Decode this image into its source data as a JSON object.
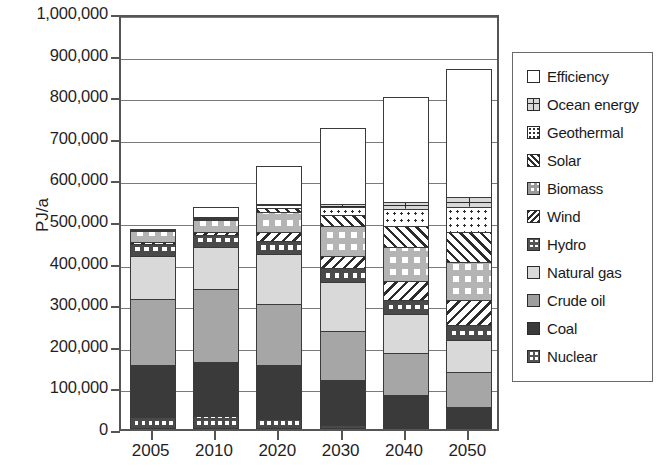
{
  "chart_data": {
    "type": "bar",
    "subtype": "stacked-column",
    "title": "",
    "xlabel": "",
    "ylabel": "PJ/a",
    "ylim": [
      0,
      1000000
    ],
    "ytick_step": 100000,
    "grid": true,
    "legend_position": "right",
    "categories": [
      "2005",
      "2010",
      "2020",
      "2030",
      "2040",
      "2050"
    ],
    "ytick_labels": [
      "0",
      "100,000",
      "200,000",
      "300,000",
      "400,000",
      "500,000",
      "600,000",
      "700,000",
      "800,000",
      "900,000",
      "1,000,000"
    ],
    "series": [
      {
        "name": "Nuclear",
        "pattern": "checker-fine",
        "values": [
          30000,
          32000,
          25000,
          10000,
          3000,
          0
        ]
      },
      {
        "name": "Coal",
        "pattern": "solid-dark",
        "values": [
          125000,
          130000,
          128000,
          108000,
          78000,
          52000
        ]
      },
      {
        "name": "Crude oil",
        "pattern": "solid-mid",
        "values": [
          158000,
          175000,
          148000,
          118000,
          100000,
          85000
        ]
      },
      {
        "name": "Natural gas",
        "pattern": "solid-light",
        "values": [
          103000,
          100000,
          120000,
          118000,
          93000,
          78000
        ]
      },
      {
        "name": "Hydro",
        "pattern": "checker-mid",
        "values": [
          30000,
          30000,
          32000,
          33000,
          35000,
          36000
        ]
      },
      {
        "name": "Wind",
        "pattern": "diag-back",
        "values": [
          3000,
          6000,
          20000,
          30000,
          45000,
          58000
        ]
      },
      {
        "name": "Biomass",
        "pattern": "checker-big",
        "values": [
          26000,
          30000,
          48000,
          70000,
          82000,
          92000
        ]
      },
      {
        "name": "Solar",
        "pattern": "diag-fwd",
        "values": [
          1000,
          3000,
          10000,
          28000,
          50000,
          72000
        ]
      },
      {
        "name": "Geothermal",
        "pattern": "dotted",
        "values": [
          1000,
          2000,
          8000,
          18000,
          42000,
          62000
        ]
      },
      {
        "name": "Ocean energy",
        "pattern": "grid-plus",
        "values": [
          0,
          1000,
          3000,
          8000,
          15000,
          22000
        ]
      },
      {
        "name": "Efficiency",
        "pattern": "white",
        "values": [
          0,
          23000,
          91000,
          184000,
          253000,
          309000
        ]
      }
    ],
    "totals": [
      477000,
      532000,
      633000,
      725000,
      796000,
      866000
    ]
  },
  "axis": {
    "y_title": "PJ/a"
  },
  "legend": {
    "items": [
      {
        "label": "Efficiency",
        "key": "efficiency"
      },
      {
        "label": "Ocean energy",
        "key": "ocean"
      },
      {
        "label": "Geothermal",
        "key": "geothermal"
      },
      {
        "label": "Solar",
        "key": "solar"
      },
      {
        "label": "Biomass",
        "key": "biomass"
      },
      {
        "label": "Wind",
        "key": "wind"
      },
      {
        "label": "Hydro",
        "key": "hydro"
      },
      {
        "label": "Natural gas",
        "key": "natgas"
      },
      {
        "label": "Crude oil",
        "key": "oil"
      },
      {
        "label": "Coal",
        "key": "coal"
      },
      {
        "label": "Nuclear",
        "key": "nuclear"
      }
    ]
  }
}
